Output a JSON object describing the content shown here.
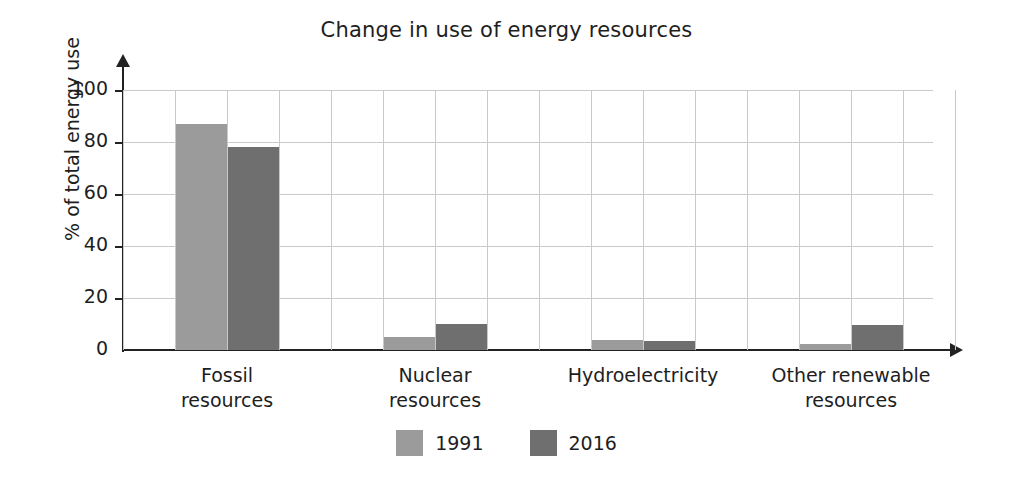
{
  "chart_data": {
    "type": "bar",
    "title": "Change in use of energy resources",
    "xlabel": "",
    "ylabel": "% of total energy use",
    "ylim": [
      0,
      100
    ],
    "yticks": [
      0,
      20,
      40,
      60,
      80,
      100
    ],
    "grid": true,
    "legend_position": "bottom",
    "categories": [
      "Fossil resources",
      "Nuclear resources",
      "Hydroelectricity",
      "Other renewable resources"
    ],
    "category_lines": [
      [
        "Fossil",
        "resources"
      ],
      [
        "Nuclear",
        "resources"
      ],
      [
        "Hydroelectricity"
      ],
      [
        "Other renewable",
        "resources"
      ]
    ],
    "series": [
      {
        "name": "1991",
        "color": "#9b9b9b",
        "values": [
          87,
          5,
          4,
          2.5
        ]
      },
      {
        "name": "2016",
        "color": "#6f6f6f",
        "values": [
          78,
          10,
          3.5,
          9.5
        ]
      }
    ]
  },
  "axis": {
    "y_title": "% of total energy use",
    "y_ticks": [
      "0",
      "20",
      "40",
      "60",
      "80",
      "100"
    ]
  },
  "legend": {
    "items": [
      {
        "label": "1991",
        "color": "#9b9b9b"
      },
      {
        "label": "2016",
        "color": "#6f6f6f"
      }
    ]
  },
  "colors": {
    "series_1991": "#9b9b9b",
    "series_2016": "#6f6f6f",
    "grid": "#c9c9c9",
    "axis": "#222222",
    "text": "#1e1e1e"
  }
}
